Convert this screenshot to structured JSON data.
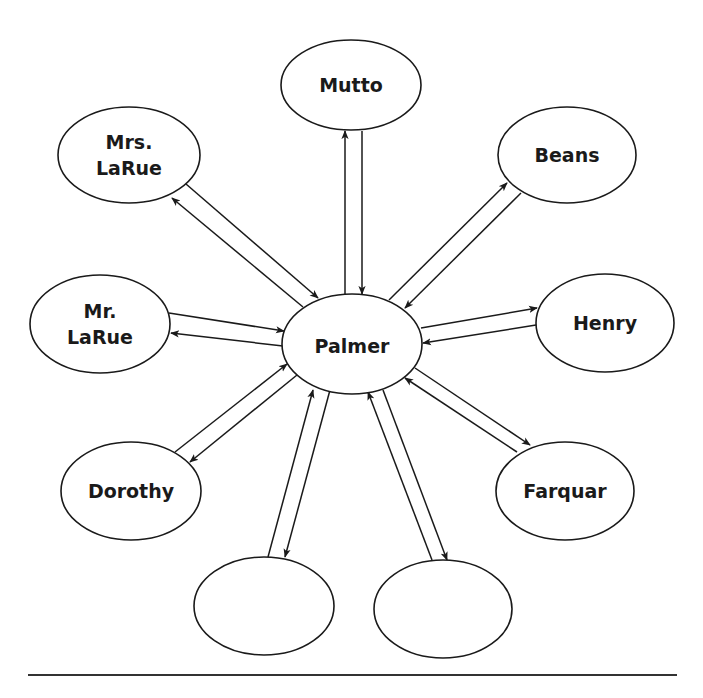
{
  "diagram": {
    "type": "character-relationship-web",
    "center": {
      "id": "palmer",
      "label": [
        "Palmer"
      ]
    },
    "nodes": [
      {
        "id": "mutto",
        "label": [
          "Mutto"
        ]
      },
      {
        "id": "mrs-larue",
        "label": [
          "Mrs.",
          "LaRue"
        ]
      },
      {
        "id": "beans",
        "label": [
          "Beans"
        ]
      },
      {
        "id": "mr-larue",
        "label": [
          "Mr.",
          "LaRue"
        ]
      },
      {
        "id": "henry",
        "label": [
          "Henry"
        ]
      },
      {
        "id": "dorothy",
        "label": [
          "Dorothy"
        ]
      },
      {
        "id": "farquar",
        "label": [
          "Farquar"
        ]
      },
      {
        "id": "blank-1",
        "label": []
      },
      {
        "id": "blank-2",
        "label": []
      }
    ],
    "edges": [
      {
        "between": [
          "palmer",
          "mutto"
        ],
        "bidirectional": true
      },
      {
        "between": [
          "palmer",
          "mrs-larue"
        ],
        "bidirectional": true
      },
      {
        "between": [
          "palmer",
          "beans"
        ],
        "bidirectional": true
      },
      {
        "between": [
          "palmer",
          "mr-larue"
        ],
        "bidirectional": true
      },
      {
        "between": [
          "palmer",
          "henry"
        ],
        "bidirectional": true
      },
      {
        "between": [
          "palmer",
          "dorothy"
        ],
        "bidirectional": true
      },
      {
        "between": [
          "palmer",
          "farquar"
        ],
        "bidirectional": true
      },
      {
        "between": [
          "palmer",
          "blank-1"
        ],
        "bidirectional": true
      },
      {
        "between": [
          "palmer",
          "blank-2"
        ],
        "bidirectional": true
      }
    ]
  },
  "colors": {
    "stroke": "#1a1a1a",
    "background": "#ffffff",
    "rule": "#333333"
  }
}
